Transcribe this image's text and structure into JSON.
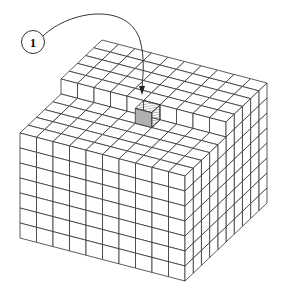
{
  "diagram": {
    "type": "isometric-cube-grid",
    "grid": {
      "width": 10,
      "depth": 10,
      "height": 8,
      "upper_depth": 5,
      "step_height": 1
    },
    "highlighted_cube": {
      "column": 5,
      "row": 5,
      "fill": "#b0b0b0",
      "hatch": true
    },
    "callout": {
      "label": "1",
      "target": "highlighted-cube"
    },
    "colors": {
      "line": "#333333",
      "face": "#ffffff",
      "highlight": "#b3b3b3",
      "background": "#ffffff"
    }
  }
}
